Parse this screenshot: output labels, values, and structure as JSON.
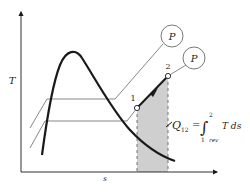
{
  "diagram": {
    "axes": {
      "y_label": "T",
      "x_label": "s"
    },
    "pressure_lines": [
      {
        "label": "P"
      },
      {
        "label": "P"
      }
    ],
    "points": [
      {
        "label": "1"
      },
      {
        "label": "2"
      }
    ],
    "equation": {
      "lhs": "Q",
      "lhs_sub": "12",
      "eq": "=",
      "integral": "∫",
      "upper": "2",
      "lower": "1",
      "lower_sub": "rev",
      "integrand": "T ds"
    },
    "colors": {
      "line": "#1a1a1a",
      "thin_line": "#555555",
      "shade": "#cfcfcf",
      "background": "#ffffff"
    }
  }
}
